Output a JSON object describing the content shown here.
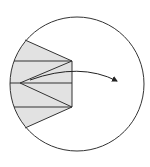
{
  "diagram": {
    "type": "geometric-figure",
    "colors": {
      "background": "#ffffff",
      "stroke": "#333333",
      "fill": "#e2e2e2"
    },
    "circle": {
      "cx": 77,
      "cy": 84,
      "r": 67
    },
    "shaded_region": {
      "points": [
        [
          25,
          40
        ],
        [
          72,
          61
        ],
        [
          72,
          107
        ],
        [
          25,
          128
        ]
      ]
    },
    "apex": [
      20,
      83
    ],
    "vertices": {
      "top_left": [
        25,
        40
      ],
      "top_right": [
        72,
        61
      ],
      "bottom_right": [
        72,
        107
      ],
      "bottom_left": [
        25,
        128
      ]
    },
    "horizontal_lines_y": [
      61,
      83,
      107
    ],
    "arrow": {
      "start": [
        30,
        80
      ],
      "control": [
        80,
        62
      ],
      "end": [
        117,
        81
      ]
    }
  }
}
